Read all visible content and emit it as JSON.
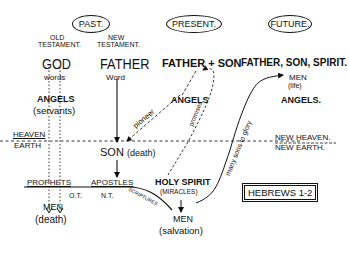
{
  "eras": {
    "past": "PAST.",
    "present": "PRESENT.",
    "future": "FUTURE."
  },
  "past": {
    "old_testament": [
      "OLD",
      "TESTAMENT."
    ],
    "new_testament": [
      "NEW",
      "TESTAMENT."
    ],
    "god": "GOD",
    "words": "words",
    "father": "FATHER",
    "word": "Word",
    "angels": "ANGELS",
    "servants": "(servants)"
  },
  "present": {
    "father_son": "FATHER + SON",
    "angels": "ANGELS",
    "son_death": "SON",
    "son_death_paren": "(death)",
    "holy_spirit": "HOLY SPIRIT",
    "miracles": "(MIRACLES)",
    "men": "MEN",
    "salvation": "(salvation)"
  },
  "future": {
    "trinity": "FATHER, SON, SPIRIT.",
    "men": "MEN",
    "life": "(life)",
    "angels": "ANGELS."
  },
  "realms": {
    "heaven": "HEAVEN",
    "earth": "EARTH",
    "new_heaven": "NEW HEAVEN.",
    "new_earth": "NEW EARTH."
  },
  "ground": {
    "prophets": "PROPHETS",
    "ot": "O.T.",
    "apostles": "APOSTLES",
    "nt": "N.T.",
    "men": "MEN",
    "death": "(death)"
  },
  "arrow_labels": {
    "pioneer": "pioneer",
    "promises": "promises",
    "scriptures": "SCRIPTURES",
    "many_sons": "many sons to glory"
  },
  "reference": "HEBREWS 1-2"
}
